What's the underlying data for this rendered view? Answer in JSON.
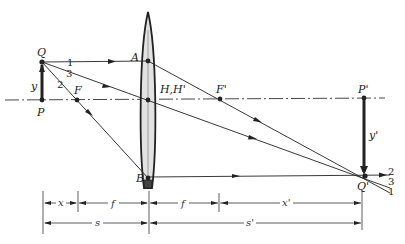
{
  "diagram": {
    "type": "thin-lens-ray-diagram",
    "colors": {
      "ink": "#222222",
      "lens_fill": "#e2e2e2",
      "axis": "#333333"
    },
    "points": {
      "object_top": "Q",
      "object_base": "P",
      "front_focus": "F",
      "principal_planes": "H,H'",
      "back_focus": "F'",
      "image_base": "P'",
      "image_top": "Q'",
      "lens_ray1_point": "A",
      "lens_ray2_point": "B"
    },
    "heights": {
      "object": "y",
      "image": "y'"
    },
    "rays": {
      "ray1": "1",
      "ray2": "2",
      "ray3": "3",
      "out_ray2": "2",
      "out_ray3": "3",
      "out_ray1": "1"
    },
    "dimensions": {
      "x": "x",
      "f_front": "f",
      "f_back": "f",
      "x_prime": "x'",
      "s": "s",
      "s_prime": "s'"
    }
  }
}
